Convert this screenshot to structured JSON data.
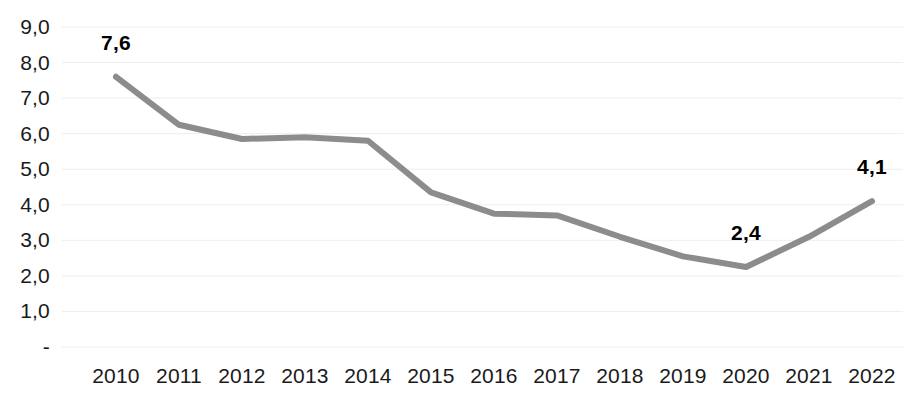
{
  "chart_data": {
    "type": "line",
    "title": "",
    "subtitle": "",
    "xlabel": "",
    "ylabel": "",
    "categories": [
      "2010",
      "2011",
      "2012",
      "2013",
      "2014",
      "2015",
      "2016",
      "2017",
      "2018",
      "2019",
      "2020",
      "2021",
      "2022"
    ],
    "values": [
      7.6,
      6.25,
      5.85,
      5.9,
      5.8,
      4.35,
      3.75,
      3.7,
      3.1,
      2.55,
      2.25,
      3.1,
      4.1
    ],
    "series": [
      {
        "name": "",
        "values": [
          7.6,
          6.25,
          5.85,
          5.9,
          5.8,
          4.35,
          3.75,
          3.7,
          3.1,
          2.55,
          2.25,
          3.1,
          4.1
        ],
        "color": "#8c8c8c"
      }
    ],
    "ylim": [
      0,
      9
    ],
    "y_ticks": [
      "-",
      "1,0",
      "2,0",
      "3,0",
      "4,0",
      "5,0",
      "6,0",
      "7,0",
      "8,0",
      "9,0"
    ],
    "y_tick_values": [
      0,
      1,
      2,
      3,
      4,
      5,
      6,
      7,
      8,
      9
    ],
    "x_tick_labels": [
      "2010",
      "2011",
      "2012",
      "2013",
      "2014",
      "2015",
      "2016",
      "2017",
      "2018",
      "2019",
      "2020",
      "2021",
      "2022"
    ],
    "grid": true,
    "grid_color": "#eeeeee",
    "legend": false,
    "legend_position": "none",
    "annotations": [
      {
        "label": "7,6",
        "category": "2010",
        "value": 7.6
      },
      {
        "label": "2,4",
        "category": "2020",
        "value": 2.25
      },
      {
        "label": "4,1",
        "category": "2022",
        "value": 4.1
      }
    ],
    "line_color": "#8c8c8c",
    "background_color": "#ffffff",
    "text_color": "#1a1a1a"
  },
  "labels": {
    "annotation_0": "7,6",
    "annotation_1": "2,4",
    "annotation_2": "4,1"
  }
}
